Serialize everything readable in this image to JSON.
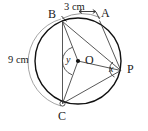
{
  "figure": {
    "type": "circle-geometry-diagram",
    "title": "",
    "circle": {
      "center_label": "O",
      "cx": 78,
      "cy": 61,
      "r": 43,
      "stroke": "#111111"
    },
    "points": [
      {
        "id": "B",
        "label": "B",
        "x": 62.5,
        "y": 21.5,
        "label_x": 49,
        "label_y": 9
      },
      {
        "id": "A",
        "label": "A",
        "x": 99.5,
        "y": 20.5,
        "label_x": 101,
        "label_y": 8
      },
      {
        "id": "P",
        "label": "P",
        "x": 120.8,
        "y": 70.5,
        "label_x": 127,
        "label_y": 64
      },
      {
        "id": "C",
        "label": "C",
        "x": 62.5,
        "y": 103.5,
        "label_x": 57,
        "label_y": 112
      },
      {
        "id": "O",
        "label": "O",
        "x": 78,
        "y": 61,
        "label_x": 85,
        "label_y": 54
      }
    ],
    "chords": [
      {
        "from": "B",
        "to": "P"
      },
      {
        "from": "A",
        "to": "P"
      },
      {
        "from": "B",
        "to": "C"
      },
      {
        "from": "C",
        "to": "P"
      }
    ],
    "radii": [
      {
        "from": "O",
        "to": "B"
      },
      {
        "from": "O",
        "to": "C"
      },
      {
        "from": "O",
        "to": "P"
      }
    ],
    "angles": [
      {
        "id": "y",
        "label": "y",
        "at": "O",
        "label_x": 68,
        "label_y": 55
      },
      {
        "id": "x",
        "label": "x",
        "at": "P",
        "label_x": 110,
        "label_y": 64
      }
    ],
    "measurements": [
      {
        "id": "arc-BA",
        "label": "3 cm",
        "arc": "B to A",
        "label_x": 65,
        "label_y": 3,
        "arrows": "double"
      },
      {
        "id": "arc-BC",
        "label": "9 cm",
        "arc": "B to C",
        "label_x": 8,
        "label_y": 55,
        "arrows": "none"
      }
    ],
    "colors": {
      "circle_stroke": "#111111",
      "line_stroke": "#3a3a3a",
      "outer_arc_stroke": "#9a9a9a",
      "label_text": "#1a1a1a",
      "background": "#ffffff"
    }
  }
}
